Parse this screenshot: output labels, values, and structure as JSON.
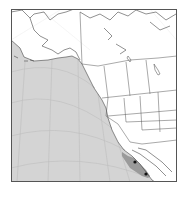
{
  "map": {
    "type": "species-range-map",
    "region": "Western North America and Northeast Pacific",
    "colors": {
      "background": "#ffffff",
      "land": "#ffffff",
      "range_light": "#d4d4d4",
      "range_dark": "#9a9a9a",
      "points": "#111111",
      "frame": "#555555"
    },
    "layers": {
      "range_light_label": "",
      "range_dark_label": "",
      "points_label": ""
    },
    "points": [
      {
        "x": 135,
        "y": 162
      },
      {
        "x": 146,
        "y": 174
      }
    ]
  }
}
